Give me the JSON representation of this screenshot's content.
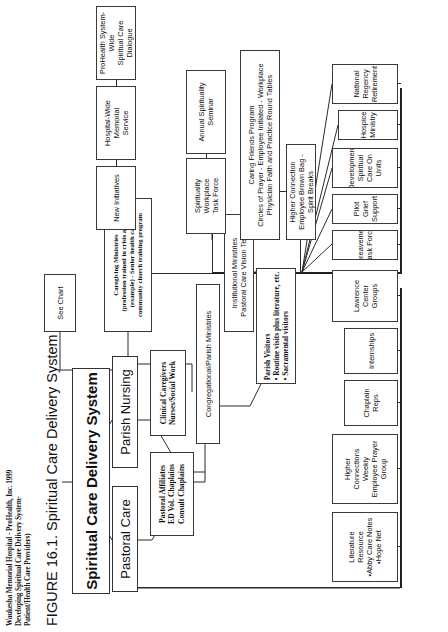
{
  "figure": {
    "caption": "FIGURE 16.1. Spiritual Care Delivery System",
    "source_note": "Waukesha Memorial Hospital - ProHealth, Inc. 1999\nDeveloping Spiritual Care Delivery System-\nPatient/Health Care Providers)"
  },
  "diagram": {
    "type": "org-chart",
    "root": {
      "label": "Spiritual Care Delivery System"
    },
    "level1": [
      {
        "id": "pastoral-care",
        "label": "Pastoral Care"
      },
      {
        "id": "parish-nursing",
        "label": "Parish Nursing"
      }
    ],
    "level2": [
      {
        "id": "pastoral-affiliates",
        "label": "Pastoral Affiliates\nED Vol. Chaplains\nConsult Chaplains"
      },
      {
        "id": "clinical-caregivers",
        "label": "Clinical Caregivers\nNurses/Social Work"
      },
      {
        "id": "congregational-parish-ministries",
        "label": "Congregational/Parish Ministries"
      },
      {
        "id": "institutional-ministries",
        "label": "Institutional Ministries\nPastoral Care Vision Team"
      }
    ],
    "pastoral_care_children": [
      {
        "id": "literature-resource",
        "label": "Literature Resource\n•Abby Care Notes\n•Hope Net"
      },
      {
        "id": "higher-connections",
        "label": "Higher Connections Weekly\nEmployee Prayer Group"
      },
      {
        "id": "chaplain-reps",
        "label": "Chaplain Reps"
      },
      {
        "id": "internships",
        "label": "Internships"
      },
      {
        "id": "lawrence-center-groups",
        "label": "Lawrence Center  Groups"
      }
    ],
    "parish_nursing_children": [
      {
        "id": "see-chart",
        "label": "See Chart"
      }
    ],
    "congregational_children": [
      {
        "id": "parish-visitors",
        "label": "Parish Visitors\n• Routine visits plus literature, etc.\n• Sacramental visitors"
      },
      {
        "id": "caregiving-ministries",
        "label": "Caregiving Ministries\n(profession trained in crisis area)\n(example) - Senior health care\ncommunity church training program"
      }
    ],
    "institutional_branch_a": [
      {
        "id": "bereavement-task-force",
        "label": "Bereavement Task Force"
      },
      {
        "id": "pilot-grief-support",
        "label": "Pilot Grief Support"
      },
      {
        "id": "development-spiritual-care",
        "label": "Development Spiritual\nCare On Units"
      },
      {
        "id": "hospice-ministry",
        "label": "Hospice Ministry"
      },
      {
        "id": "national-regency-retirement",
        "label": "National Regency\nRetirement"
      }
    ],
    "institutional_branch_b": [
      {
        "id": "higher-connection-brown-bag",
        "label": "Higher Connection\nEmployee Brown Bag - Spirit Breaks"
      },
      {
        "id": "caring-friends-program",
        "label": "Caring Friends Program\nCircles of Prayer - Employee Initiated - Workplace\nPhysician Faith and Practice Round Tables"
      }
    ],
    "institutional_branch_c": [
      {
        "id": "spirituality-workplace-task-force",
        "label": "Spirituality Workplace\nTask Force"
      },
      {
        "id": "annual-spirituality-seminar",
        "label": "Annual Spirituality Seminar"
      }
    ],
    "institutional_branch_d": [
      {
        "id": "new-initiatives",
        "label": "New Initiatives"
      },
      {
        "id": "hospital-wide-memorial-service",
        "label": "Hospital-Wide Memorial\nService"
      },
      {
        "id": "prohealth-system-wide-dialogue",
        "label": "ProHealth System-Wide\nSpiritual Care Dialogue"
      }
    ]
  }
}
